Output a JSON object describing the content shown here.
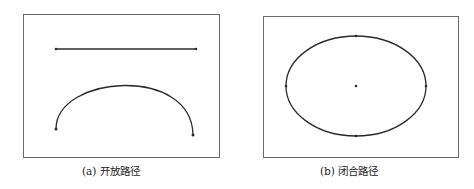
{
  "figure": {
    "panels": [
      {
        "id": "a",
        "caption": "(a) 开放路径",
        "shapes": [
          "straight-line",
          "open-arc"
        ]
      },
      {
        "id": "b",
        "caption": "(b) 闭合路径",
        "shapes": [
          "ellipse",
          "center-point"
        ]
      }
    ],
    "colors": {
      "stroke": "#2a2a2a",
      "border": "#6a6a6a"
    }
  }
}
